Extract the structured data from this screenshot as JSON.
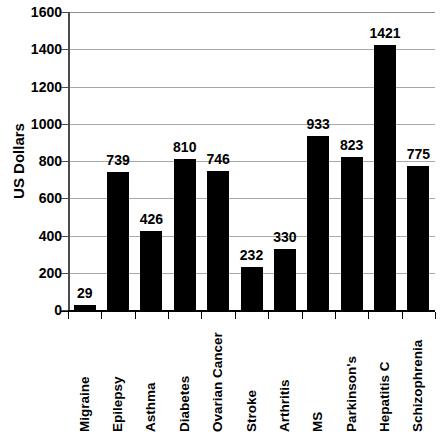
{
  "chart_data": {
    "type": "bar",
    "title": "",
    "xlabel": "",
    "ylabel": "US Dollars",
    "ylim": [
      0,
      1600
    ],
    "ytick_step": 200,
    "yticks": [
      "1600",
      "1400",
      "1200",
      "1000",
      "800",
      "600",
      "400",
      "200",
      "0"
    ],
    "grid": true,
    "legend": false,
    "bar_color": "#000000",
    "gridline_color": "#a8a8a8",
    "categories": [
      "Migraine",
      "Epilepsy",
      "Asthma",
      "Diabetes",
      "Ovarian Cancer",
      "Stroke",
      "Arthritis",
      "MS",
      "Parkinson's",
      "Hepatitis C",
      "Schizophrenia"
    ],
    "values": [
      29,
      739,
      426,
      810,
      746,
      232,
      330,
      933,
      823,
      1421,
      775
    ],
    "value_labels": [
      "29",
      "739",
      "426",
      "810",
      "746",
      "232",
      "330",
      "933",
      "823",
      "1421",
      "775"
    ]
  }
}
